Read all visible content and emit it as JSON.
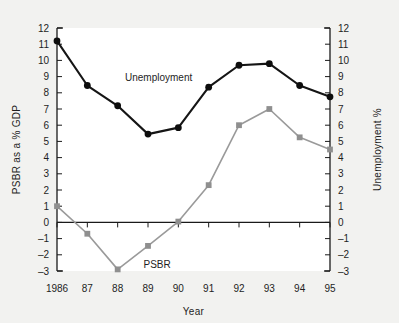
{
  "chart_data": {
    "type": "line",
    "title": "",
    "xlabel": "Year",
    "ylabel": "PSBR  as a % GDP",
    "ylabel_right": "Unemployment %",
    "x": [
      1986,
      1987,
      1988,
      1989,
      1990,
      1991,
      1992,
      1993,
      1994,
      1995
    ],
    "categories": [
      "1986",
      "87",
      "88",
      "89",
      "90",
      "91",
      "92",
      "93",
      "94",
      "95"
    ],
    "ylim": [
      -3,
      12
    ],
    "ylim_right": [
      -3,
      12
    ],
    "yticks": [
      -3,
      -2,
      -1,
      0,
      1,
      2,
      3,
      4,
      5,
      6,
      7,
      8,
      9,
      10,
      11,
      12
    ],
    "ytick_labels": [
      "–3",
      "–2",
      "–1",
      "0",
      "1",
      "2",
      "3",
      "4",
      "5",
      "6",
      "7",
      "8",
      "9",
      "10",
      "11",
      "12"
    ],
    "ytick_labels_right": [
      "–3",
      "–2",
      "–1",
      "0",
      "1",
      "2",
      "3",
      "4",
      "5",
      "6",
      "7",
      "8",
      "9",
      "10",
      "11",
      "12"
    ],
    "grid": false,
    "legend_position": "inline-annotation",
    "zero_line": true,
    "series": [
      {
        "name": "Unemployment",
        "axis": "right",
        "color": "#0d0d0d",
        "marker": "circle",
        "label_x": 1989.35,
        "label_y": 8.75,
        "values": [
          11.2,
          8.45,
          7.2,
          5.45,
          5.85,
          8.35,
          9.7,
          9.8,
          8.45,
          7.75
        ]
      },
      {
        "name": "PSBR",
        "axis": "left",
        "color": "#8f8f8f",
        "marker": "square",
        "label_x": 1989.3,
        "label_y": -2.8,
        "values": [
          1.0,
          -0.7,
          -2.9,
          -1.45,
          0.05,
          2.3,
          6.0,
          7.0,
          5.25,
          4.5
        ]
      }
    ]
  },
  "figure": {
    "background_color": "#f2f2f0",
    "plot_background_color": "#ffffff",
    "axis_color": "#1a1a1a"
  }
}
